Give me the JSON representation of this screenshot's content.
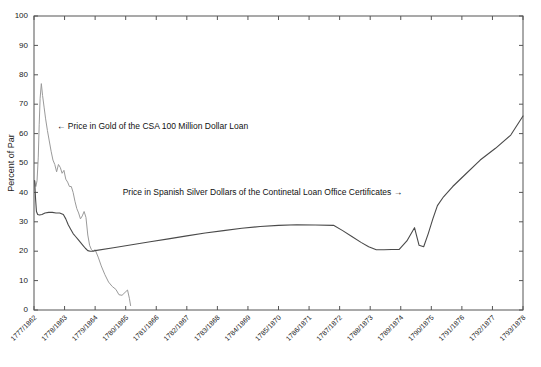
{
  "chart_data": {
    "type": "line",
    "title": "",
    "xlabel": "",
    "ylabel": "Percent of Par",
    "ylim": [
      0,
      100
    ],
    "ytick_step": 10,
    "yticks": [
      0,
      10,
      20,
      30,
      40,
      50,
      60,
      70,
      80,
      90,
      100
    ],
    "grid": false,
    "legend_position": "none",
    "categories": [
      "1777/1862",
      "1778/1863",
      "1779/1864",
      "1780/1865",
      "1781/1866",
      "1782/1867",
      "1783/1868",
      "1784/1869",
      "1785/1870",
      "1786/1871",
      "1787/1872",
      "1788/1873",
      "1789/1874",
      "1790/1875",
      "1791/1876",
      "1792/1877",
      "1793/1878"
    ],
    "annotations": [
      {
        "id": "csa-annotation",
        "text": "← Price in Gold of the CSA 100 Million Dollar Loan",
        "x_value": 0.75,
        "y_value": 61.5,
        "series": "csa_gold"
      },
      {
        "id": "continental-annotation",
        "text": "Price in Spanish Silver Dollars of the Continetal Loan Office Certificates →",
        "x_value": 2.9,
        "y_value": 39.0,
        "series": "continental_silver"
      }
    ],
    "series": [
      {
        "name": "Price in Gold of the CSA 100 Million Dollar Loan",
        "short_name": "csa_gold",
        "color": "#9a9a9a",
        "x": [
          0.02,
          0.06,
          0.1,
          0.14,
          0.17,
          0.2,
          0.24,
          0.28,
          0.33,
          0.38,
          0.44,
          0.5,
          0.56,
          0.62,
          0.68,
          0.74,
          0.8,
          0.86,
          0.92,
          0.98,
          1.04,
          1.1,
          1.16,
          1.22,
          1.28,
          1.34,
          1.4,
          1.46,
          1.52,
          1.58,
          1.64,
          1.7,
          1.76,
          1.82,
          1.88,
          1.94,
          2.0,
          2.1,
          2.2,
          2.32,
          2.44,
          2.56,
          2.68,
          2.78,
          2.88,
          2.98,
          3.06,
          3.12,
          3.16
        ],
        "values": [
          44.0,
          42.0,
          44.0,
          52.0,
          63.0,
          72.0,
          77.0,
          73.0,
          69.0,
          65.0,
          61.0,
          57.5,
          54.0,
          51.0,
          49.5,
          47.0,
          49.5,
          48.5,
          46.5,
          47.5,
          44.5,
          43.5,
          42.0,
          42.0,
          40.0,
          37.0,
          34.5,
          33.0,
          31.0,
          32.0,
          33.5,
          31.5,
          25.5,
          22.0,
          20.5,
          20.0,
          20.5,
          18.0,
          15.0,
          12.0,
          9.5,
          8.0,
          7.0,
          5.2,
          5.0,
          6.0,
          6.8,
          4.0,
          1.5
        ]
      },
      {
        "name": "Price in Spanish Silver Dollars of the Continetal Loan Office Certificates",
        "short_name": "continental_silver",
        "color": "#4a4a4a",
        "x": [
          0.02,
          0.05,
          0.08,
          0.12,
          0.18,
          0.26,
          0.36,
          0.48,
          0.6,
          0.72,
          0.84,
          0.96,
          1.04,
          1.12,
          1.2,
          1.28,
          1.36,
          1.44,
          1.52,
          1.6,
          1.68,
          1.76,
          1.84,
          1.92,
          2.0,
          2.6,
          3.2,
          3.8,
          4.4,
          5.0,
          5.6,
          6.2,
          6.8,
          7.4,
          8.0,
          8.6,
          9.2,
          9.8,
          10.1,
          10.4,
          10.7,
          10.95,
          11.2,
          11.45,
          11.7,
          11.95,
          12.2,
          12.45,
          12.6,
          12.75,
          12.9,
          13.05,
          13.2,
          13.4,
          13.7,
          14.1,
          14.6,
          15.1,
          15.6,
          16.0
        ],
        "values": [
          44.0,
          38.0,
          33.5,
          32.5,
          32.3,
          32.5,
          33.0,
          33.2,
          33.2,
          33.0,
          33.0,
          32.5,
          31.0,
          29.0,
          27.5,
          26.0,
          25.0,
          24.0,
          23.0,
          22.0,
          21.0,
          20.2,
          20.0,
          20.0,
          20.2,
          21.2,
          22.2,
          23.2,
          24.2,
          25.2,
          26.2,
          27.0,
          27.8,
          28.4,
          28.8,
          29.0,
          28.9,
          28.8,
          27.0,
          25.0,
          23.0,
          21.5,
          20.5,
          20.5,
          20.6,
          20.6,
          23.5,
          28.0,
          22.0,
          21.5,
          26.0,
          31.0,
          35.5,
          38.5,
          42.0,
          46.0,
          51.0,
          55.0,
          59.5,
          66.0
        ]
      }
    ]
  }
}
